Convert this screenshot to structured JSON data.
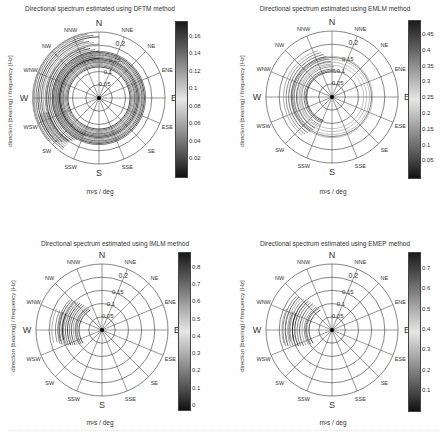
{
  "shared": {
    "ylabel": "direction [bearing] / frequency [Hz]",
    "xlabel": "m²s / deg",
    "compass": [
      "N",
      "NNE",
      "NE",
      "ENE",
      "E",
      "ESE",
      "SE",
      "SSE",
      "S",
      "SSW",
      "SW",
      "WSW",
      "W",
      "WNW",
      "NW",
      "NNW"
    ],
    "radial_ticks": [
      "0.05",
      "0.1",
      "0.15",
      "0.2"
    ]
  },
  "panels": [
    {
      "title": "Directional spectrum estimated using  DFTM method",
      "colorbar_ticks": [
        "0.16",
        "0.14",
        "0.12",
        "0.1",
        "0.08",
        "0.06",
        "0.04",
        "0.02"
      ]
    },
    {
      "title": "Directional spectrum estimated using  EMLM method",
      "colorbar_ticks": [
        "0.45",
        "0.4",
        "0.35",
        "0.3",
        "0.25",
        "0.2",
        "0.15",
        "0.1",
        "0.05"
      ]
    },
    {
      "title": "Directional spectrum estimated using  IMLM method",
      "colorbar_ticks": [
        "0.8",
        "0.7",
        "0.6",
        "0.5",
        "0.4",
        "0.3",
        "0.2",
        "0.1",
        "0"
      ]
    },
    {
      "title": "Directional spectrum estimated using  EMEP method",
      "colorbar_ticks": [
        "0.7",
        "0.6",
        "0.5",
        "0.4",
        "0.3",
        "0.2",
        "0.1"
      ]
    }
  ],
  "chart_data": [
    {
      "type": "heatmap",
      "subtype": "polar-contour",
      "title": "Directional spectrum estimated using  DFTM method",
      "xlabel": "m²s / deg",
      "ylabel": "direction [bearing] / frequency [Hz]",
      "radial_axis": {
        "label": "frequency [Hz]",
        "ticks": [
          0.05,
          0.1,
          0.15,
          0.2
        ],
        "range": [
          0,
          0.25
        ]
      },
      "angular_axis": {
        "labels": [
          "N",
          "NNE",
          "NE",
          "ENE",
          "E",
          "ESE",
          "SE",
          "SSE",
          "S",
          "SSW",
          "SW",
          "WSW",
          "W",
          "WNW",
          "NW",
          "NNW"
        ],
        "step_deg": 22.5
      },
      "colorbar": {
        "range": [
          0,
          0.17
        ],
        "ticks": [
          0.02,
          0.04,
          0.06,
          0.08,
          0.1,
          0.12,
          0.14,
          0.16
        ]
      },
      "description": "Broad, nearly omnidirectional concentric contours around 0.07-0.1 Hz with energy spread towards W/WNW/SW out to ~0.2 Hz"
    },
    {
      "type": "heatmap",
      "subtype": "polar-contour",
      "title": "Directional spectrum estimated using  EMLM method",
      "xlabel": "m²s / deg",
      "ylabel": "direction [bearing] / frequency [Hz]",
      "radial_axis": {
        "label": "frequency [Hz]",
        "ticks": [
          0.05,
          0.1,
          0.15,
          0.2
        ],
        "range": [
          0,
          0.25
        ]
      },
      "angular_axis": {
        "labels": [
          "N",
          "NNE",
          "NE",
          "ENE",
          "E",
          "ESE",
          "SE",
          "SSE",
          "S",
          "SSW",
          "SW",
          "WSW",
          "W",
          "WNW",
          "NW",
          "NNW"
        ],
        "step_deg": 22.5
      },
      "colorbar": {
        "range": [
          0,
          0.48
        ],
        "ticks": [
          0.05,
          0.1,
          0.15,
          0.2,
          0.25,
          0.3,
          0.35,
          0.4,
          0.45
        ]
      },
      "description": "Contours concentrated in W-WNW sector between ~0.06 and 0.14 Hz with partial rings"
    },
    {
      "type": "heatmap",
      "subtype": "polar-contour",
      "title": "Directional spectrum estimated using  IMLM method",
      "xlabel": "m²s / deg",
      "ylabel": "direction [bearing] / frequency [Hz]",
      "radial_axis": {
        "label": "frequency [Hz]",
        "ticks": [
          0.05,
          0.1,
          0.15,
          0.2
        ],
        "range": [
          0,
          0.25
        ]
      },
      "angular_axis": {
        "labels": [
          "N",
          "NNE",
          "NE",
          "ENE",
          "E",
          "ESE",
          "SE",
          "SSE",
          "S",
          "SSW",
          "SW",
          "WSW",
          "W",
          "WNW",
          "NW",
          "NNW"
        ],
        "step_deg": 22.5
      },
      "colorbar": {
        "range": [
          0,
          0.82
        ],
        "ticks": [
          0,
          0.1,
          0.2,
          0.3,
          0.4,
          0.5,
          0.6,
          0.7,
          0.8
        ]
      },
      "description": "Narrow peak in WNW-W sector between ~0.07 and 0.15 Hz"
    },
    {
      "type": "heatmap",
      "subtype": "polar-contour",
      "title": "Directional spectrum estimated using  EMEP method",
      "xlabel": "m²s / deg",
      "ylabel": "direction [bearing] / frequency [Hz]",
      "radial_axis": {
        "label": "frequency [Hz]",
        "ticks": [
          0.05,
          0.1,
          0.15,
          0.2
        ],
        "range": [
          0,
          0.25
        ]
      },
      "angular_axis": {
        "labels": [
          "N",
          "NNE",
          "NE",
          "ENE",
          "E",
          "ESE",
          "SE",
          "SSE",
          "S",
          "SSW",
          "SW",
          "WSW",
          "W",
          "WNW",
          "NW",
          "NNW"
        ],
        "step_deg": 22.5
      },
      "colorbar": {
        "range": [
          0,
          0.76
        ],
        "ticks": [
          0.1,
          0.2,
          0.3,
          0.4,
          0.5,
          0.6,
          0.7
        ]
      },
      "description": "Narrow peak in WNW-W sector between ~0.07 and 0.17 Hz"
    }
  ]
}
